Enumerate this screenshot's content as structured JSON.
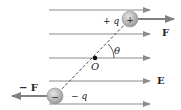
{
  "diagram": {
    "field_label": "E",
    "origin_label": "O",
    "angle_label": "θ",
    "positive_charge": {
      "sign": "+",
      "label": "+ q",
      "force_label": "F"
    },
    "negative_charge": {
      "sign": "−",
      "label": "− q",
      "force_label": "− F"
    },
    "field_line_count": 5,
    "colors": {
      "field_line": "#8c8c8c",
      "charge_fill": "#b5b5b5",
      "force_arrow": "#808080",
      "dipole_axis": "#333333"
    }
  }
}
